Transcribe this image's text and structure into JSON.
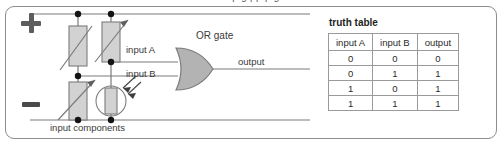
{
  "figure": {
    "clipped_caption_top": "a p       g  pp         p    g",
    "circuit": {
      "supply_plus_symbol": "+",
      "supply_minus_symbol": "−",
      "labels": {
        "input_a": "input A",
        "input_b": "input B",
        "gate": "OR gate",
        "output": "output",
        "input_components": "input components"
      },
      "components": [
        {
          "name": "variable-resistor-top-left",
          "type": "variable resistor"
        },
        {
          "name": "variable-resistor-top-right",
          "type": "variable resistor"
        },
        {
          "name": "variable-resistor-bottom-left",
          "type": "variable resistor"
        },
        {
          "name": "light-dependent-resistor",
          "type": "LDR"
        }
      ],
      "colors": {
        "wire": "#6e6e6e",
        "component_fill": "#d2d2d2",
        "gate_fill": "#b3b3b3",
        "junction_dot": "#1a1a1a",
        "frame_border": "#8d8d8d"
      }
    },
    "truth_table": {
      "title": "truth table",
      "columns": [
        "input A",
        "input B",
        "output"
      ],
      "rows": [
        [
          "0",
          "0",
          "0"
        ],
        [
          "0",
          "1",
          "1"
        ],
        [
          "1",
          "0",
          "1"
        ],
        [
          "1",
          "1",
          "1"
        ]
      ]
    }
  }
}
